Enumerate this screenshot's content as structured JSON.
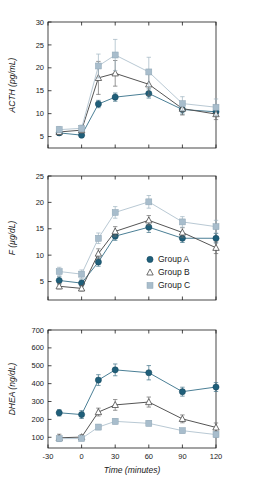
{
  "figure": {
    "background": "#ffffff",
    "xlabel": "Time (minutes)",
    "x_ticks": [
      "-30",
      "0",
      "30",
      "60",
      "90",
      "120"
    ],
    "x_tick_values": [
      -30,
      0,
      30,
      60,
      90,
      120
    ],
    "xlim": [
      -30,
      120
    ]
  },
  "colors": {
    "group_a": "#1f5f7a",
    "group_b": "#3a3a3a",
    "group_c": "#a8bdcc",
    "group_c_line": "#b9c9d4",
    "axis": "#1a1a1a",
    "text": "#1a1a1a"
  },
  "legend": {
    "position": "middle-panel-right",
    "entries": [
      {
        "label": "Group A",
        "marker": "filled-circle",
        "color": "#1f5f7a"
      },
      {
        "label": "Group B",
        "marker": "open-triangle",
        "color": "#3a3a3a"
      },
      {
        "label": "Group C",
        "marker": "filled-square",
        "color": "#a8bdcc"
      }
    ]
  },
  "chart_data": [
    {
      "type": "line",
      "panel": "top",
      "title": "",
      "xlabel": "",
      "ylabel": "ACTH (pg/mL)",
      "ylim": [
        2.5,
        30
      ],
      "y_ticks": [
        5,
        10,
        15,
        20,
        25,
        30
      ],
      "y_tick_labels": [
        "5",
        "10",
        "15",
        "20",
        "25",
        "30"
      ],
      "xlim": [
        -30,
        120
      ],
      "x": [
        -20,
        0,
        15,
        30,
        60,
        90,
        120
      ],
      "grid": false,
      "legend_position": "none",
      "series": [
        {
          "name": "Group A",
          "marker": "filled-circle",
          "color": "#1f5f7a",
          "values": [
            5.8,
            5.3,
            12.1,
            13.6,
            14.4,
            10.9,
            10.4
          ],
          "errors": [
            0.5,
            0.4,
            0.8,
            0.9,
            1.0,
            1.0,
            0.9
          ]
        },
        {
          "name": "Group B",
          "marker": "open-triangle",
          "color": "#3a3a3a",
          "values": [
            6.0,
            6.4,
            17.8,
            18.8,
            16.4,
            11.1,
            9.9
          ],
          "errors": [
            0.6,
            0.6,
            3.6,
            2.8,
            2.4,
            1.4,
            1.2
          ]
        },
        {
          "name": "Group C",
          "marker": "filled-square",
          "color": "#a8bdcc",
          "values": [
            6.5,
            6.8,
            20.4,
            22.8,
            19.1,
            12.2,
            11.4
          ],
          "errors": [
            0.7,
            0.7,
            2.6,
            3.4,
            3.2,
            1.5,
            1.8
          ]
        }
      ]
    },
    {
      "type": "line",
      "panel": "middle",
      "title": "",
      "xlabel": "",
      "ylabel": "F (µg/dL)",
      "ylim": [
        1.5,
        25
      ],
      "y_ticks": [
        5,
        10,
        15,
        20,
        25
      ],
      "y_tick_labels": [
        "5",
        "10",
        "15",
        "20",
        "25"
      ],
      "xlim": [
        -30,
        120
      ],
      "x": [
        -20,
        0,
        15,
        30,
        60,
        90,
        120
      ],
      "grid": false,
      "legend_position": "lower-right",
      "series": [
        {
          "name": "Group A",
          "marker": "filled-circle",
          "color": "#1f5f7a",
          "values": [
            5.2,
            4.7,
            8.7,
            13.6,
            15.3,
            13.2,
            13.2
          ],
          "errors": [
            0.7,
            0.6,
            0.8,
            0.8,
            1.0,
            0.8,
            0.9
          ]
        },
        {
          "name": "Group B",
          "marker": "open-triangle",
          "color": "#3a3a3a",
          "values": [
            4.1,
            3.7,
            10.3,
            14.5,
            16.6,
            14.3,
            11.4
          ],
          "errors": [
            0.5,
            0.5,
            0.9,
            0.9,
            0.9,
            0.9,
            1.1
          ]
        },
        {
          "name": "Group C",
          "marker": "filled-square",
          "color": "#a8bdcc",
          "values": [
            6.9,
            6.4,
            13.2,
            18.1,
            20.1,
            16.3,
            15.4
          ],
          "errors": [
            0.8,
            0.8,
            1.0,
            1.1,
            1.2,
            1.0,
            1.2
          ]
        }
      ]
    },
    {
      "type": "line",
      "panel": "bottom",
      "title": "",
      "xlabel": "Time (minutes)",
      "ylabel": "DHEA (ng/dL)",
      "ylim": [
        40,
        700
      ],
      "y_ticks": [
        100,
        200,
        300,
        400,
        500,
        600,
        700
      ],
      "y_tick_labels": [
        "100",
        "200",
        "300",
        "400",
        "500",
        "600",
        "700"
      ],
      "xlim": [
        -30,
        120
      ],
      "x": [
        -20,
        0,
        15,
        30,
        60,
        90,
        120
      ],
      "grid": false,
      "legend_position": "none",
      "series": [
        {
          "name": "Group A",
          "marker": "filled-circle",
          "color": "#1f5f7a",
          "values": [
            237,
            227,
            420,
            477,
            461,
            355,
            381
          ],
          "errors": [
            18,
            22,
            30,
            33,
            40,
            25,
            25
          ]
        },
        {
          "name": "Group B",
          "marker": "open-triangle",
          "color": "#3a3a3a",
          "values": [
            97,
            101,
            241,
            281,
            297,
            203,
            155
          ],
          "errors": [
            20,
            13,
            22,
            30,
            28,
            22,
            25
          ]
        },
        {
          "name": "Group C",
          "marker": "filled-square",
          "color": "#a8bdcc",
          "values": [
            92,
            93,
            157,
            189,
            178,
            137,
            115
          ],
          "errors": [
            16,
            12,
            15,
            15,
            14,
            13,
            16
          ]
        }
      ]
    }
  ]
}
